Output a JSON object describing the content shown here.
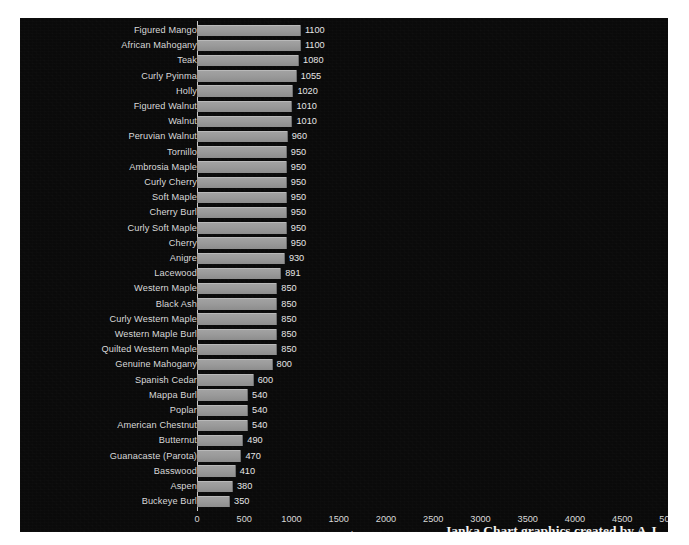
{
  "chart_data": {
    "type": "bar",
    "orientation": "horizontal",
    "title": "",
    "xlabel": "",
    "ylabel": "",
    "xlim": [
      0,
      5000
    ],
    "xticks": [
      0,
      500,
      1000,
      1500,
      2000,
      2500,
      3000,
      3500,
      4000,
      4500,
      5000
    ],
    "xtick_labels": [
      "0",
      "500",
      "1000",
      "1500",
      "2000",
      "2500",
      "3000",
      "3500",
      "4000",
      "4500",
      "5000"
    ],
    "grid": false,
    "legend_position": "bottom-center",
    "series": [
      {
        "name": "Janka",
        "values": [
          1100,
          1100,
          1080,
          1055,
          1020,
          1010,
          1010,
          960,
          950,
          950,
          950,
          950,
          950,
          950,
          950,
          930,
          891,
          850,
          850,
          850,
          850,
          850,
          800,
          600,
          540,
          540,
          540,
          490,
          470,
          410,
          380,
          350
        ]
      }
    ],
    "categories": [
      "Figured Mango",
      "African Mahogany",
      "Teak",
      "Curly Pyinma",
      "Holly",
      "Figured Walnut",
      "Walnut",
      "Peruvian Walnut",
      "Tornillo",
      "Ambrosia Maple",
      "Curly Cherry",
      "Soft Maple",
      "Cherry Burl",
      "Curly Soft Maple",
      "Cherry",
      "Anigre",
      "Lacewood",
      "Western Maple",
      "Black Ash",
      "Curly Western Maple",
      "Western Maple Burl",
      "Quilted Western Maple",
      "Genuine Mahogany",
      "Spanish Cedar",
      "Mappa Burl",
      "Poplar",
      "American Chestnut",
      "Butternut",
      "Guanacaste (Parota)",
      "Basswood",
      "Aspen",
      "Buckeye Burl"
    ],
    "data_labels": [
      "1100",
      "1100",
      "1080",
      "1055",
      "1020",
      "1010",
      "1010",
      "960",
      "950",
      "950",
      "950",
      "950",
      "950",
      "950",
      "950",
      "930",
      "891",
      "850",
      "850",
      "850",
      "850",
      "850",
      "800",
      "600",
      "540",
      "540",
      "540",
      "490",
      "470",
      "410",
      "380",
      "350"
    ],
    "colors": {
      "background": "#0a0a0a",
      "bar": "#9a9a9a",
      "bar_highlight": "#b9b9b9",
      "text": "#d9d9d9",
      "axis": "#c8c8c8",
      "page": "#ffffff"
    }
  },
  "legend": {
    "swatch_icon": "square-marker-icon",
    "label": "Janka"
  },
  "credit": {
    "text": "Janka Chart graphics created by A.J."
  }
}
